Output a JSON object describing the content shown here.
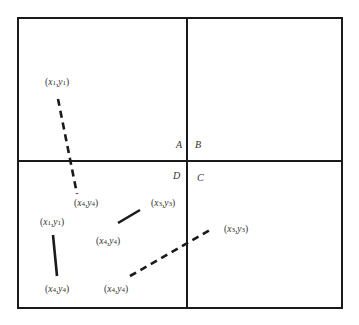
{
  "diagram": {
    "colors": {
      "stroke": "#1a1a1a",
      "text": "#333333",
      "background": "#ffffff"
    },
    "outer_box": {
      "x1": 18,
      "y1": 18,
      "x2": 342,
      "y2": 308
    },
    "dividers": {
      "vertical_x": 187,
      "horizontal_y": 161
    },
    "quadrant_labels": [
      {
        "id": "A",
        "text": "A",
        "x": 176,
        "y": 148
      },
      {
        "id": "B",
        "text": "B",
        "x": 195,
        "y": 148
      },
      {
        "id": "D",
        "text": "D",
        "x": 173,
        "y": 179
      },
      {
        "id": "C",
        "text": "C",
        "x": 197,
        "y": 181
      }
    ],
    "segments": [
      {
        "id": "seg-dashed-vertical",
        "style": "dashed",
        "x1": 58,
        "y1": 99,
        "x2": 77,
        "y2": 194
      },
      {
        "id": "seg-solid-left",
        "style": "solid",
        "x1": 53,
        "y1": 235,
        "x2": 57,
        "y2": 276
      },
      {
        "id": "seg-solid-short",
        "style": "solid",
        "x1": 118,
        "y1": 223,
        "x2": 140,
        "y2": 210
      },
      {
        "id": "seg-dashed-diagonal",
        "style": "dashed",
        "x1": 130,
        "y1": 276,
        "x2": 210,
        "y2": 230
      }
    ],
    "point_labels": [
      {
        "id": "lbl-top-x1y1",
        "text": "(x1,y1)",
        "x": 45,
        "y": 85
      },
      {
        "id": "lbl-mid-x4y4",
        "text": "(x4,y4)",
        "x": 74,
        "y": 206
      },
      {
        "id": "lbl-x3y3-short",
        "text": "(x3,y3)",
        "x": 151,
        "y": 206
      },
      {
        "id": "lbl-left-x1y1",
        "text": "(x1,y1)",
        "x": 40,
        "y": 225
      },
      {
        "id": "lbl-short-x4y4",
        "text": "(x4,y4)",
        "x": 96,
        "y": 244
      },
      {
        "id": "lbl-right-x3y3",
        "text": "(x3,y3)",
        "x": 224,
        "y": 232
      },
      {
        "id": "lbl-bottom-left-x4y4",
        "text": "(x4,y4)",
        "x": 45,
        "y": 292
      },
      {
        "id": "lbl-bottom-mid-x4y4",
        "text": "(x4,y4)",
        "x": 104,
        "y": 292
      }
    ]
  }
}
